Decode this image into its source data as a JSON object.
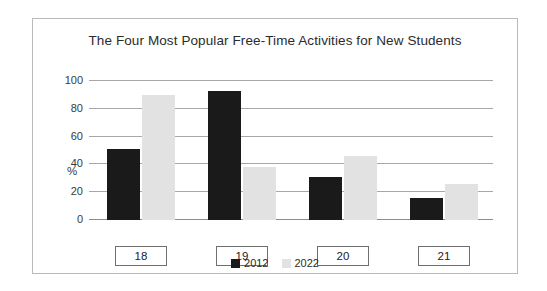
{
  "chart_data": {
    "type": "bar",
    "title": "The Four Most Popular Free-Time Activities for New Students",
    "categories": [
      "18",
      "19",
      "20",
      "21"
    ],
    "series": [
      {
        "name": "2012",
        "color": "#1a1a1a",
        "values": [
          51,
          93,
          31,
          16
        ]
      },
      {
        "name": "2022",
        "color": "#e2e2e2",
        "values": [
          90,
          38,
          46,
          26
        ]
      }
    ],
    "xlabel": "",
    "ylabel": "%",
    "ylim": [
      0,
      100
    ],
    "yticks": [
      "0",
      "20",
      "40",
      "60",
      "80",
      "100"
    ],
    "grid": true,
    "legend_position": "bottom-center"
  }
}
